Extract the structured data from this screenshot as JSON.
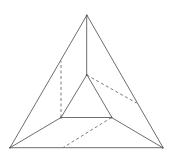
{
  "diagram": {
    "type": "truncated-pyramid-figure",
    "colors": {
      "line": "#6e6e6e",
      "dashed": "#7a7a7a",
      "background": "#ffffff"
    },
    "outer_triangle": {
      "top": [
        86.7,
        15.5
      ],
      "bottom_left": [
        10,
        147.7
      ],
      "bottom_right": [
        162.7,
        147.7
      ]
    },
    "inner_triangle": {
      "top": [
        86.7,
        75
      ],
      "bottom_left": [
        61,
        117.5
      ],
      "bottom_right": [
        111.5,
        117.5
      ]
    },
    "connecting_edges": [
      {
        "from": "outer.top",
        "to": "inner.top"
      },
      {
        "from": "outer.bottom_left",
        "to": "inner.bottom_left"
      },
      {
        "from": "outer.bottom_right",
        "to": "inner.bottom_right"
      }
    ],
    "dashed_edges": [
      {
        "from": [
          61,
          117.5
        ],
        "to": [
          61,
          61
        ]
      },
      {
        "from": [
          86.7,
          75
        ],
        "to": [
          136.5,
          103
        ]
      },
      {
        "from": [
          111.5,
          117.5
        ],
        "to": [
          63,
          147.7
        ]
      }
    ]
  }
}
